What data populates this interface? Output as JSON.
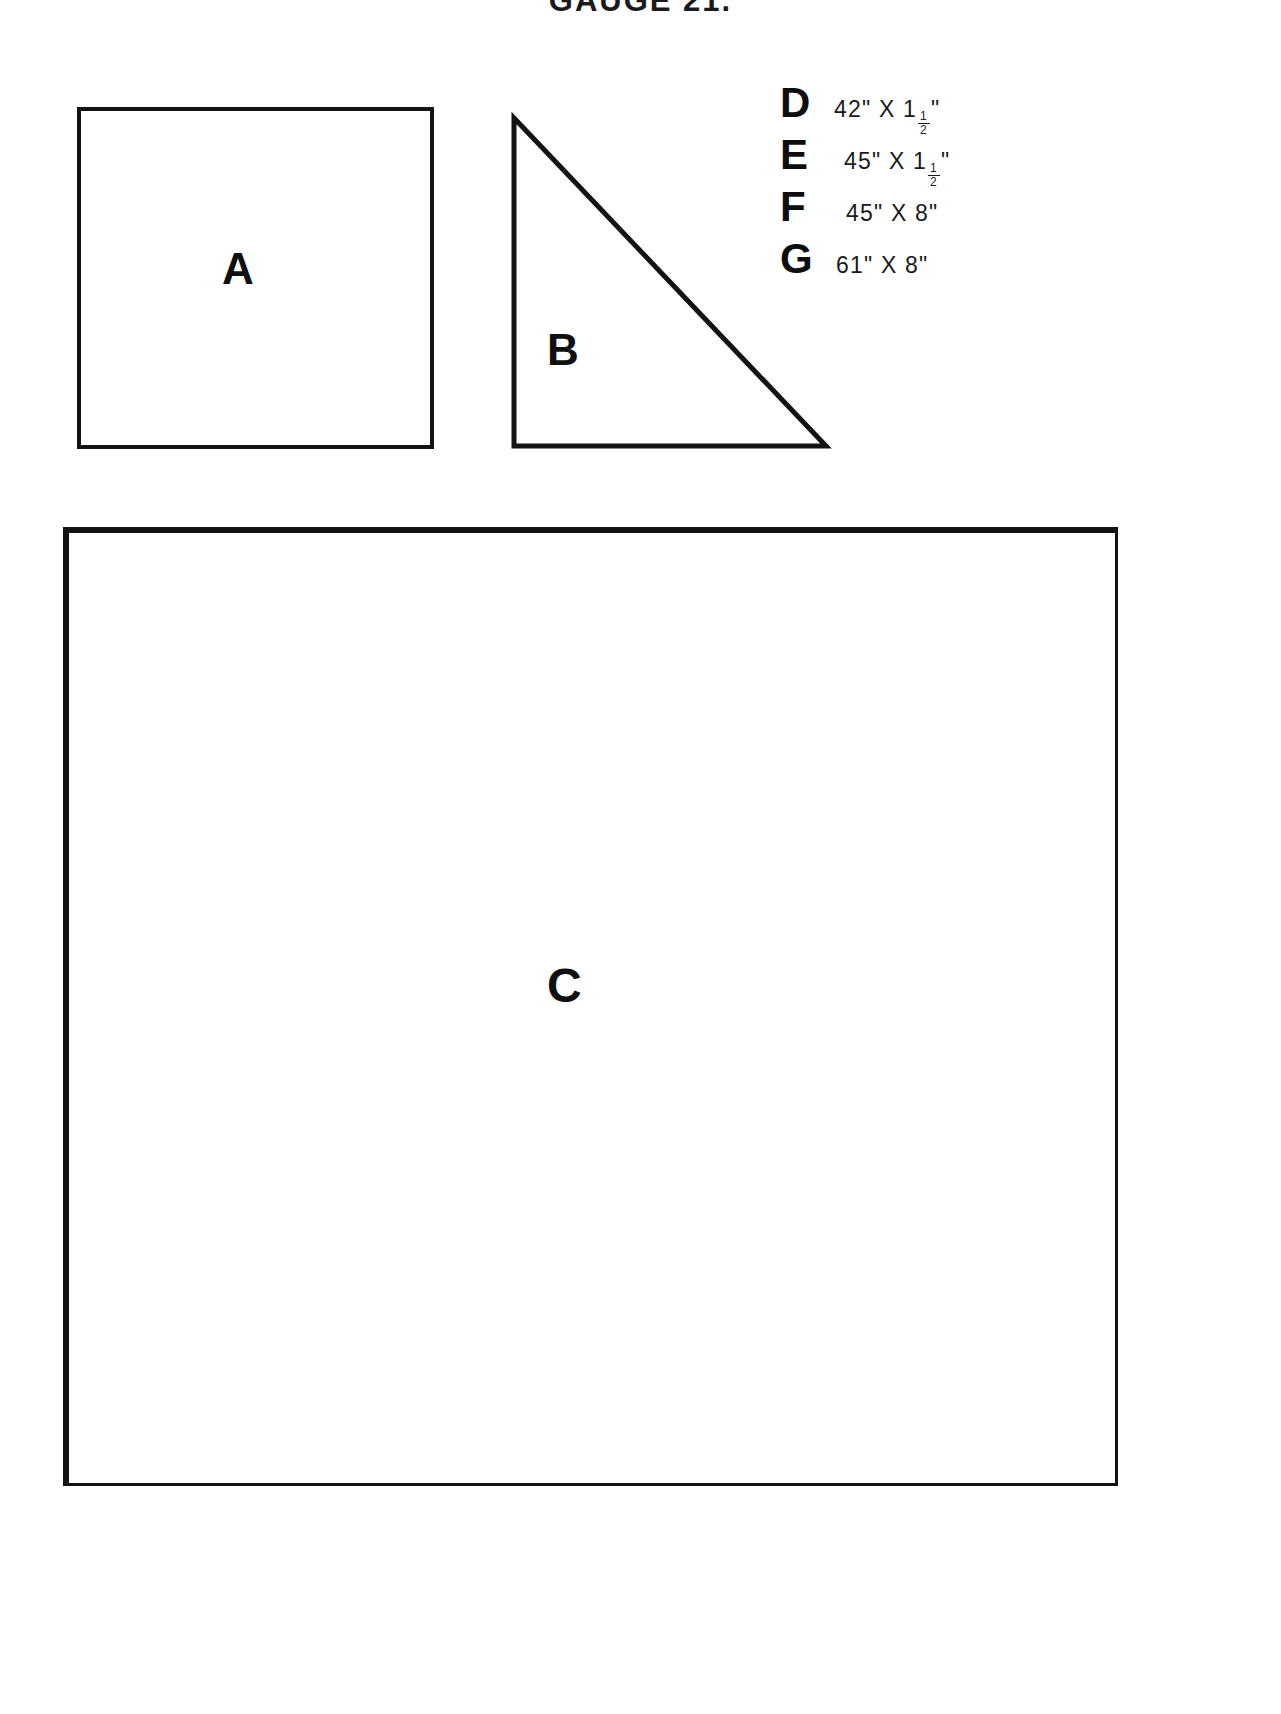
{
  "document": {
    "title": "GAUGE 21.",
    "type": "cutting-layout-diagram"
  },
  "shapes": [
    {
      "id": "A",
      "label": "A",
      "form": "square"
    },
    {
      "id": "B",
      "label": "B",
      "form": "right-triangle"
    },
    {
      "id": "C",
      "label": "C",
      "form": "square"
    }
  ],
  "legend": {
    "rows": [
      {
        "key": "D",
        "width": "42\"",
        "times": "X",
        "height_whole": "1",
        "height_num": "1",
        "height_den": "2",
        "height_unit": "\"",
        "full": "42\" X 1½\""
      },
      {
        "key": "E",
        "width": "45\"",
        "times": "X",
        "height_whole": "1",
        "height_num": "1",
        "height_den": "2",
        "height_unit": "\"",
        "full": "45\" X 1½\""
      },
      {
        "key": "F",
        "width": "45\"",
        "times": "X",
        "height_whole": "8",
        "height_num": "",
        "height_den": "",
        "height_unit": "\"",
        "full": "45\" X 8\""
      },
      {
        "key": "G",
        "width": "61\"",
        "times": "X",
        "height_whole": "8",
        "height_num": "",
        "height_den": "",
        "height_unit": "\"",
        "full": "61\" X 8\""
      }
    ]
  },
  "colors": {
    "ink": "#131313",
    "paper": "#ffffff"
  }
}
